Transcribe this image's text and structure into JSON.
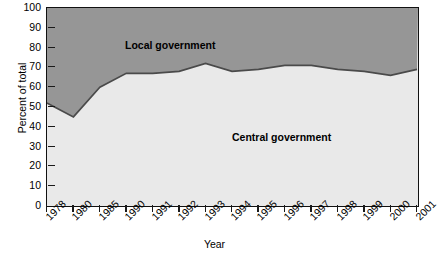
{
  "chart_data": {
    "type": "area",
    "title": "",
    "subtitle": "",
    "xlabel": "Year",
    "ylabel": "Percent of total",
    "ylim": [
      0,
      100
    ],
    "ytick_step": 10,
    "yticks": [
      0,
      10,
      20,
      30,
      40,
      50,
      60,
      70,
      80,
      90,
      100
    ],
    "grid": false,
    "legend_position": "inside-annotations",
    "categories": [
      "1978",
      "1980",
      "1985",
      "1990",
      "1991",
      "1992",
      "1993",
      "1994",
      "1995",
      "1996",
      "1997",
      "1998",
      "1999",
      "2000",
      "2001"
    ],
    "series": [
      {
        "name": "Central government",
        "values": [
          52,
          45,
          60,
          67,
          67,
          68,
          72,
          68,
          69,
          71,
          71,
          69,
          68,
          66,
          69
        ],
        "color": "#e9e9e9",
        "stacked_from": 0
      },
      {
        "name": "Local government",
        "values": [
          48,
          55,
          40,
          33,
          33,
          32,
          28,
          32,
          31,
          29,
          29,
          31,
          32,
          34,
          31
        ],
        "color": "#969696",
        "stacked_from": "Central government"
      }
    ],
    "annotations": [
      {
        "text": "Local government",
        "x": "1985",
        "y": 84,
        "bold": true
      },
      {
        "text": "Central government",
        "x": "1993",
        "y": 35,
        "bold": true
      }
    ],
    "line_color": "#4a4a4a",
    "frame_color": "#111111"
  },
  "axes": {
    "y": {
      "title": "Percent of total",
      "ticks": [
        "100",
        "90",
        "80",
        "70",
        "60",
        "50",
        "40",
        "30",
        "20",
        "10",
        "0"
      ]
    },
    "x": {
      "title": "Year",
      "ticks": [
        "1978",
        "1980",
        "1985",
        "1990",
        "1991",
        "1992",
        "1993",
        "1994",
        "1995",
        "1996",
        "1997",
        "1998",
        "1999",
        "2000",
        "2001"
      ]
    }
  },
  "annotations": {
    "local": "Local government",
    "central": "Central government"
  }
}
